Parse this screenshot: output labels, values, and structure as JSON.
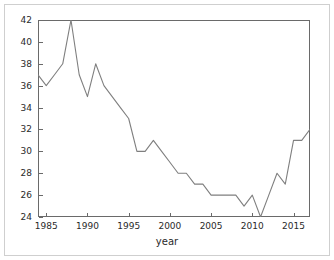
{
  "figure": {
    "background_color": "#ffffff",
    "border_color": "#cfcfcf",
    "axis_color": "#6a6a6a",
    "line_color": "#7f7f7f",
    "text_color": "#2a2a2a"
  },
  "axis": {
    "xlabel": "year",
    "ylabel": "",
    "title": "",
    "xticks": [
      "1985",
      "1990",
      "1995",
      "2000",
      "2005",
      "2010",
      "2015"
    ],
    "yticks": [
      "24",
      "26",
      "28",
      "30",
      "32",
      "34",
      "36",
      "38",
      "40",
      "42"
    ]
  },
  "chart_data": {
    "type": "line",
    "title": "",
    "xlabel": "year",
    "ylabel": "",
    "xlim": [
      1984,
      2017
    ],
    "ylim": [
      24,
      42
    ],
    "grid": false,
    "legend": null,
    "xticks": [
      1985,
      1990,
      1995,
      2000,
      2005,
      2010,
      2015
    ],
    "yticks": [
      24,
      26,
      28,
      30,
      32,
      34,
      36,
      38,
      40,
      42
    ],
    "x": [
      1984,
      1985,
      1986,
      1987,
      1988,
      1989,
      1990,
      1991,
      1992,
      1993,
      1994,
      1995,
      1996,
      1997,
      1998,
      1999,
      2000,
      2001,
      2002,
      2003,
      2004,
      2005,
      2006,
      2007,
      2008,
      2009,
      2010,
      2011,
      2012,
      2013,
      2014,
      2015,
      2016,
      2017
    ],
    "values": [
      37,
      36,
      37,
      38,
      42,
      37,
      35,
      38,
      36,
      35,
      34,
      33,
      30,
      30,
      31,
      30,
      29,
      28,
      28,
      27,
      27,
      26,
      26,
      26,
      26,
      25,
      26,
      24,
      26,
      28,
      27,
      31,
      31,
      32
    ],
    "series": [
      {
        "name": "value",
        "values": [
          37,
          36,
          37,
          38,
          42,
          37,
          35,
          38,
          36,
          35,
          34,
          33,
          30,
          30,
          31,
          30,
          29,
          28,
          28,
          27,
          27,
          26,
          26,
          26,
          26,
          25,
          26,
          24,
          26,
          28,
          27,
          31,
          31,
          32
        ]
      }
    ]
  }
}
